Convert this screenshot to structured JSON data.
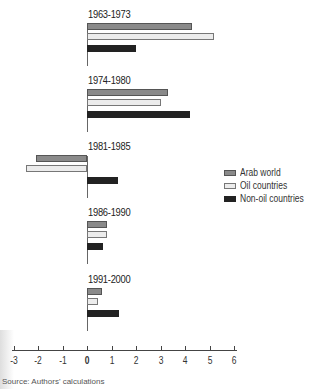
{
  "chart_data": {
    "type": "bar",
    "orientation": "horizontal",
    "title": "",
    "xlabel": "",
    "ylabel": "",
    "xlim": [
      -3,
      6
    ],
    "x_ticks": [
      -3,
      -2,
      -1,
      0,
      1,
      2,
      3,
      4,
      5,
      6
    ],
    "grid": false,
    "legend_position": "right",
    "categories": [
      "1963-1973",
      "1974-1980",
      "1981-1985",
      "1986-1990",
      "1991-2000"
    ],
    "series": [
      {
        "name": "Arab world",
        "color": "#8a8a8a",
        "values": [
          4.3,
          3.3,
          -2.1,
          0.8,
          0.6
        ]
      },
      {
        "name": "Oil countries",
        "color": "#ececec",
        "values": [
          5.2,
          3.0,
          -2.5,
          0.8,
          0.45
        ]
      },
      {
        "name": "Non-oil countries",
        "color": "#222222",
        "values": [
          2.0,
          4.2,
          1.25,
          0.65,
          1.3
        ]
      }
    ],
    "source": "Source: Authors' calculations"
  },
  "panels": [
    {
      "title": "1963-1973"
    },
    {
      "title": "1974-1980"
    },
    {
      "title": "1981-1985"
    },
    {
      "title": "1986-1990"
    },
    {
      "title": "1991-2000"
    }
  ],
  "legend": [
    {
      "label": "Arab world",
      "key": "arab"
    },
    {
      "label": "Oil countries",
      "key": "oil"
    },
    {
      "label": "Non-oil countries",
      "key": "nonoil"
    }
  ],
  "axis": {
    "ticks": [
      "-3",
      "-2",
      "-1",
      "0",
      "1",
      "2",
      "3",
      "4",
      "5",
      "6"
    ]
  },
  "source": "Source: Authors' calculations"
}
